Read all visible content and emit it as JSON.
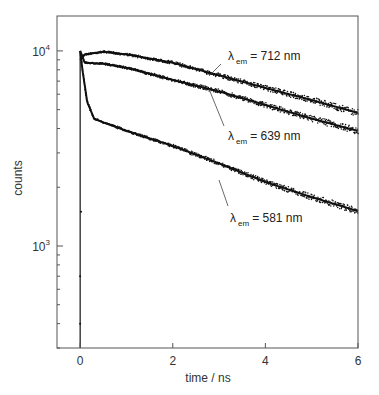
{
  "chart_data": {
    "type": "scatter",
    "title": "",
    "xlabel": "time  / ns",
    "ylabel": "counts",
    "yscale": "log",
    "xlim": [
      -0.5,
      6
    ],
    "ylim": [
      300,
      15100
    ],
    "x_ticks": [
      0,
      2,
      4,
      6
    ],
    "x_tick_labels": [
      "0",
      "2",
      "4",
      "6"
    ],
    "y_ticks": [
      1000,
      10000
    ],
    "y_tick_labels": [
      {
        "base": "10",
        "exp": "3"
      },
      {
        "base": "10",
        "exp": "4"
      }
    ],
    "grid": false,
    "legend": null,
    "series": [
      {
        "name": "λem = 712 nm",
        "label_prefix": "λ",
        "label_sub": "em",
        "label_value": "= 712 nm",
        "x": [
          0.0,
          0.1,
          0.5,
          1.0,
          2.0,
          3.0,
          4.0,
          5.0,
          6.0
        ],
        "y": [
          9000,
          9600,
          9900,
          9600,
          8700,
          7500,
          6460,
          5600,
          4810
        ]
      },
      {
        "name": "λem = 639 nm",
        "label_prefix": "λ",
        "label_sub": "em",
        "label_value": "= 639 nm",
        "x": [
          0.0,
          0.1,
          0.5,
          1.0,
          2.0,
          3.0,
          4.0,
          5.0,
          6.0
        ],
        "y": [
          10000,
          8700,
          8600,
          8200,
          7100,
          6200,
          5280,
          4500,
          3890
        ]
      },
      {
        "name": "λem = 581 nm",
        "label_prefix": "λ",
        "label_sub": "em",
        "label_value": "= 581 nm",
        "x": [
          0.0,
          0.05,
          0.15,
          0.3,
          0.5,
          1.0,
          2.0,
          3.0,
          4.0,
          5.0,
          6.0
        ],
        "y": [
          10000,
          8000,
          5500,
          4500,
          4300,
          3900,
          3260,
          2650,
          2130,
          1780,
          1510
        ]
      }
    ],
    "annotations": [
      {
        "text": "λem = 712 nm",
        "x": 3.2,
        "y": 11000
      },
      {
        "text": "λem = 639 nm",
        "x": 3.2,
        "y": 5600
      },
      {
        "text": "λem = 581 nm",
        "x": 3.25,
        "y": 2100
      }
    ]
  }
}
